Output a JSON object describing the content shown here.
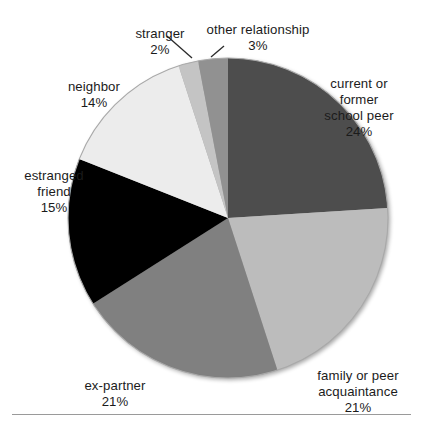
{
  "chart_data": {
    "type": "pie",
    "title": "",
    "subtitle": "",
    "xlabel": "",
    "ylabel": "",
    "legend_position": "none",
    "grid": false,
    "units": "percent",
    "total": 100,
    "start_angle_deg": 0,
    "direction": "clockwise",
    "center": {
      "x": 228,
      "y": 218
    },
    "radius": 160,
    "categories": [
      "current or former school peer",
      "family or peer acquaintance",
      "ex-partner",
      "estranged friend",
      "neighbor",
      "stranger",
      "other relationship"
    ],
    "values": [
      24,
      21,
      21,
      15,
      14,
      2,
      3
    ],
    "slices": [
      {
        "id": "school-peer",
        "label": "current or\nformer\nschool peer",
        "label_flat": "current or former school peer",
        "value": 24,
        "percent_text": "24%",
        "color": "#4d4d4d",
        "start_deg": 0,
        "end_deg": 86.4,
        "has_leader_line": false
      },
      {
        "id": "family-peer",
        "label": "family or peer\nacquaintance",
        "label_flat": "family or peer acquaintance",
        "value": 21,
        "percent_text": "21%",
        "color": "#bcbcbc",
        "start_deg": 86.4,
        "end_deg": 162.0,
        "has_leader_line": false
      },
      {
        "id": "ex-partner",
        "label": "ex-partner",
        "label_flat": "ex-partner",
        "value": 21,
        "percent_text": "21%",
        "color": "#808080",
        "start_deg": 162.0,
        "end_deg": 237.6,
        "has_leader_line": false
      },
      {
        "id": "estranged-friend",
        "label": "estranged\nfriend",
        "label_flat": "estranged friend",
        "value": 15,
        "percent_text": "15%",
        "color": "#000000",
        "start_deg": 237.6,
        "end_deg": 291.6,
        "has_leader_line": false
      },
      {
        "id": "neighbor",
        "label": "neighbor",
        "label_flat": "neighbor",
        "value": 14,
        "percent_text": "14%",
        "color": "#ececec",
        "start_deg": 291.6,
        "end_deg": 342.0,
        "has_leader_line": false
      },
      {
        "id": "stranger",
        "label": "stranger",
        "label_flat": "stranger",
        "value": 2,
        "percent_text": "2%",
        "color": "#c4c4c4",
        "start_deg": 342.0,
        "end_deg": 349.2,
        "has_leader_line": true
      },
      {
        "id": "other-relationship",
        "label": "other relationship",
        "label_flat": "other relationship",
        "value": 3,
        "percent_text": "3%",
        "color": "#919191",
        "start_deg": 349.2,
        "end_deg": 360.0,
        "has_leader_line": true
      }
    ]
  },
  "labels": {
    "school_peer": {
      "name": "current or\nformer\nschool peer",
      "percent": "24%"
    },
    "family_peer": {
      "name": "family or peer\nacquaintance",
      "percent": "21%"
    },
    "ex_partner": {
      "name": "ex-partner",
      "percent": "21%"
    },
    "estranged_friend": {
      "name": "estranged\nfriend",
      "percent": "15%"
    },
    "neighbor": {
      "name": "neighbor",
      "percent": "14%"
    },
    "stranger": {
      "name": "stranger",
      "percent": "2%"
    },
    "other_relationship": {
      "name": "other relationship",
      "percent": "3%"
    }
  },
  "style": {
    "background": "#ffffff",
    "text_color": "#1b1b1b",
    "rule_color": "#9a9a9a",
    "leader_line_color": "#2a2a2a",
    "pie_edge_color": "#a8a8a8"
  }
}
